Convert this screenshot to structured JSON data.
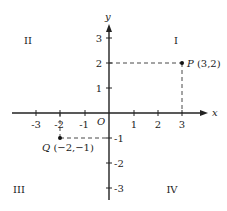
{
  "diagram": {
    "type": "cartesian-plane",
    "axes": {
      "x_label": "x",
      "y_label": "y",
      "origin_label": "O",
      "x_ticks": [
        "-3",
        "-2",
        "-1",
        "1",
        "2",
        "3"
      ],
      "y_ticks": [
        "3",
        "2",
        "1",
        "-1",
        "-2",
        "-3"
      ]
    },
    "quadrants": {
      "q1": "I",
      "q2": "II",
      "q3": "III",
      "q4": "IV"
    },
    "points": [
      {
        "name": "P",
        "coords": "(3,2)",
        "x": 3,
        "y": 2
      },
      {
        "name": "Q",
        "coords": "(−2,−1)",
        "x": -2,
        "y": -1
      }
    ]
  }
}
